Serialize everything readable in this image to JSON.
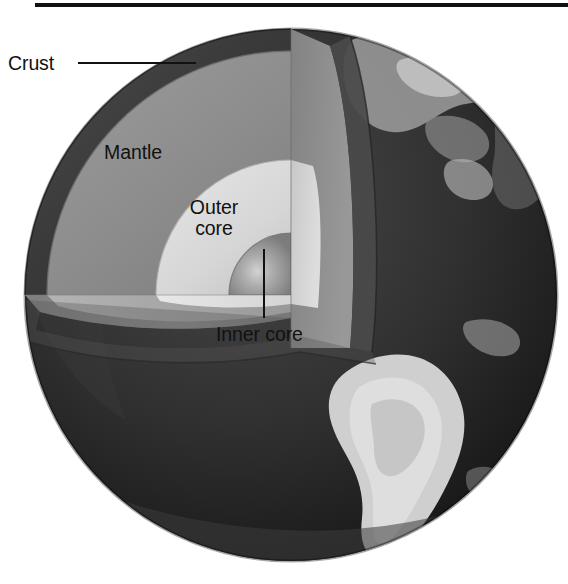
{
  "figure": {
    "background_color": "#ffffff",
    "top_rule_color": "#111111"
  },
  "labels": {
    "crust": "Crust",
    "mantle": "Mantle",
    "outer_core": "Outer core",
    "inner_core": "Inner core"
  },
  "layers": [
    {
      "name": "crust",
      "label": "Crust",
      "color": "#3b3b3b",
      "description": "Thin dark outer rim of the cutaway wedge"
    },
    {
      "name": "mantle",
      "label": "Mantle",
      "color": "#8d8d8d",
      "description": "Mid grey layer beneath the crust"
    },
    {
      "name": "outer-core",
      "label": "Outer core",
      "color": "#d8d8d8",
      "description": "Light grey layer inside the mantle"
    },
    {
      "name": "inner-core",
      "label": "Inner core",
      "color": "#909090",
      "description": "Small quarter-sphere at the centre"
    }
  ],
  "globe": {
    "ocean_color": "#2a2a2a",
    "land_color": "#c9c9c9",
    "center_x": 291,
    "center_y": 295,
    "radius": 266
  },
  "leader_lines": [
    {
      "name": "crust-leader",
      "from": [
        78,
        63
      ],
      "to": [
        196,
        63
      ]
    },
    {
      "name": "inner-core-leader",
      "from": [
        264,
        249
      ],
      "to": [
        264,
        318
      ]
    }
  ]
}
